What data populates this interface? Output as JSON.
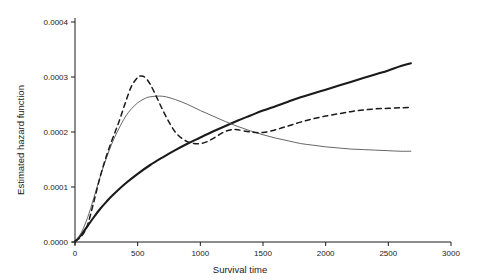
{
  "chart_data": {
    "type": "line",
    "title": "",
    "xlabel": "Survival time",
    "ylabel": "Estimated hazard function",
    "xlim": [
      0,
      3000
    ],
    "ylim": [
      0,
      0.0004
    ],
    "grid": false,
    "legend": "none",
    "xticks": [
      "0",
      "500",
      "1000",
      "1500",
      "2000",
      "2500",
      "3000"
    ],
    "xtick_values": [
      0,
      500,
      1000,
      1500,
      2000,
      2500,
      3000
    ],
    "yticks": [
      "0.0000",
      "0.0001",
      "0.0002",
      "0.0003",
      "0.0004"
    ],
    "ytick_values": [
      0,
      0.0001,
      0.0002,
      0.0003,
      0.0004
    ],
    "series": [
      {
        "name": "smooth-increasing-hazard",
        "style": "solid-thick",
        "color": "#1a1a1a",
        "x": [
          0,
          50,
          100,
          150,
          200,
          250,
          300,
          400,
          500,
          600,
          700,
          800,
          900,
          1000,
          1100,
          1200,
          1300,
          1400,
          1500,
          1600,
          1700,
          1800,
          1900,
          2000,
          2100,
          2200,
          2300,
          2400,
          2500,
          2600,
          2680
        ],
        "y": [
          0.0,
          1.3e-05,
          2.9e-05,
          4.5e-05,
          6e-05,
          7.3e-05,
          8.5e-05,
          0.000106,
          0.000124,
          0.00014,
          0.000154,
          0.000167,
          0.000179,
          0.00019,
          0.000201,
          0.000211,
          0.000221,
          0.00023,
          0.000239,
          0.000247,
          0.000255,
          0.000263,
          0.00027,
          0.000277,
          0.000284,
          0.000291,
          0.000298,
          0.000305,
          0.000312,
          0.00032,
          0.000325
        ]
      },
      {
        "name": "kernel-smoothed-hazard",
        "style": "solid-thin",
        "color": "#555555",
        "x": [
          0,
          50,
          100,
          150,
          200,
          250,
          300,
          350,
          400,
          450,
          500,
          550,
          600,
          700,
          800,
          900,
          1000,
          1100,
          1200,
          1300,
          1400,
          1500,
          1600,
          1700,
          1800,
          1900,
          2000,
          2100,
          2200,
          2300,
          2400,
          2500,
          2600,
          2680
        ],
        "y": [
          0.0,
          1.7e-05,
          4.4e-05,
          8e-05,
          0.000118,
          0.000152,
          0.000182,
          0.000206,
          0.000227,
          0.000242,
          0.000253,
          0.00026,
          0.000264,
          0.000265,
          0.000259,
          0.00025,
          0.000239,
          0.000229,
          0.000219,
          0.00021,
          0.000202,
          0.000195,
          0.000189,
          0.000184,
          0.000179,
          0.000176,
          0.000173,
          0.000171,
          0.000169,
          0.000168,
          0.000167,
          0.000166,
          0.000165,
          0.000165
        ]
      },
      {
        "name": "dashed-hazard",
        "style": "dashed",
        "color": "#1a1a1a",
        "x": [
          0,
          50,
          100,
          150,
          200,
          250,
          300,
          350,
          400,
          450,
          500,
          530,
          560,
          600,
          650,
          700,
          750,
          800,
          850,
          900,
          950,
          1000,
          1050,
          1100,
          1150,
          1200,
          1250,
          1300,
          1400,
          1500,
          1600,
          1700,
          1800,
          1900,
          2000,
          2100,
          2200,
          2300,
          2400,
          2500,
          2600,
          2680
        ],
        "y": [
          2e-06,
          1e-05,
          3.1e-05,
          7.3e-05,
          0.000118,
          0.000156,
          0.000188,
          0.000218,
          0.000252,
          0.000283,
          0.000299,
          0.000302,
          0.000299,
          0.000287,
          0.000264,
          0.00024,
          0.000218,
          0.0002,
          0.000189,
          0.000182,
          0.000179,
          0.000179,
          0.000182,
          0.000188,
          0.000195,
          0.000201,
          0.000204,
          0.000204,
          0.0002,
          0.000199,
          0.000204,
          0.000211,
          0.000218,
          0.000224,
          0.000229,
          0.000233,
          0.000237,
          0.00024,
          0.000242,
          0.000243,
          0.000244,
          0.000245
        ]
      }
    ]
  },
  "axes": {
    "x_axis_label": "Survival time",
    "y_axis_label": "Estimated hazard function"
  }
}
